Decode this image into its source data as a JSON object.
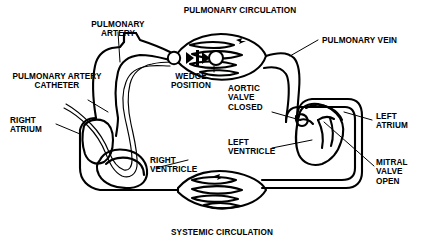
{
  "figure": {
    "line_color": "#000000",
    "background_color": "#ffffff"
  },
  "labels": {
    "pulmonary_circulation": "PULMONARY CIRCULATION",
    "systemic_circulation": "SYSTEMIC CIRCULATION",
    "pulmonary_artery": "PULMONARY\nARTERY",
    "pulmonary_artery_catheter": "PULMONARY ARTERY\nCATHETER",
    "pulmonary_vein": "PULMONARY VEIN",
    "wedge_position": "WEDGE\nPOSITION",
    "right_atrium": "RIGHT\nATRIUM",
    "right_ventricle": "RIGHT\nVENTRICLE",
    "left_atrium": "LEFT\nATRIUM",
    "left_ventricle": "LEFT\nVENTRICLE",
    "aortic_valve_closed": "AORTIC\nVALVE\nCLOSED",
    "mitral_valve_open": "MITRAL\nVALVE\nOPEN"
  },
  "icons": {
    "balloon_tip": "catheter-balloon-icon",
    "flow_arrows": "blood-flow-arrow-icon",
    "lung_capillary_bed": "capillary-bed-icon",
    "systemic_capillary_bed": "capillary-bed-icon"
  }
}
